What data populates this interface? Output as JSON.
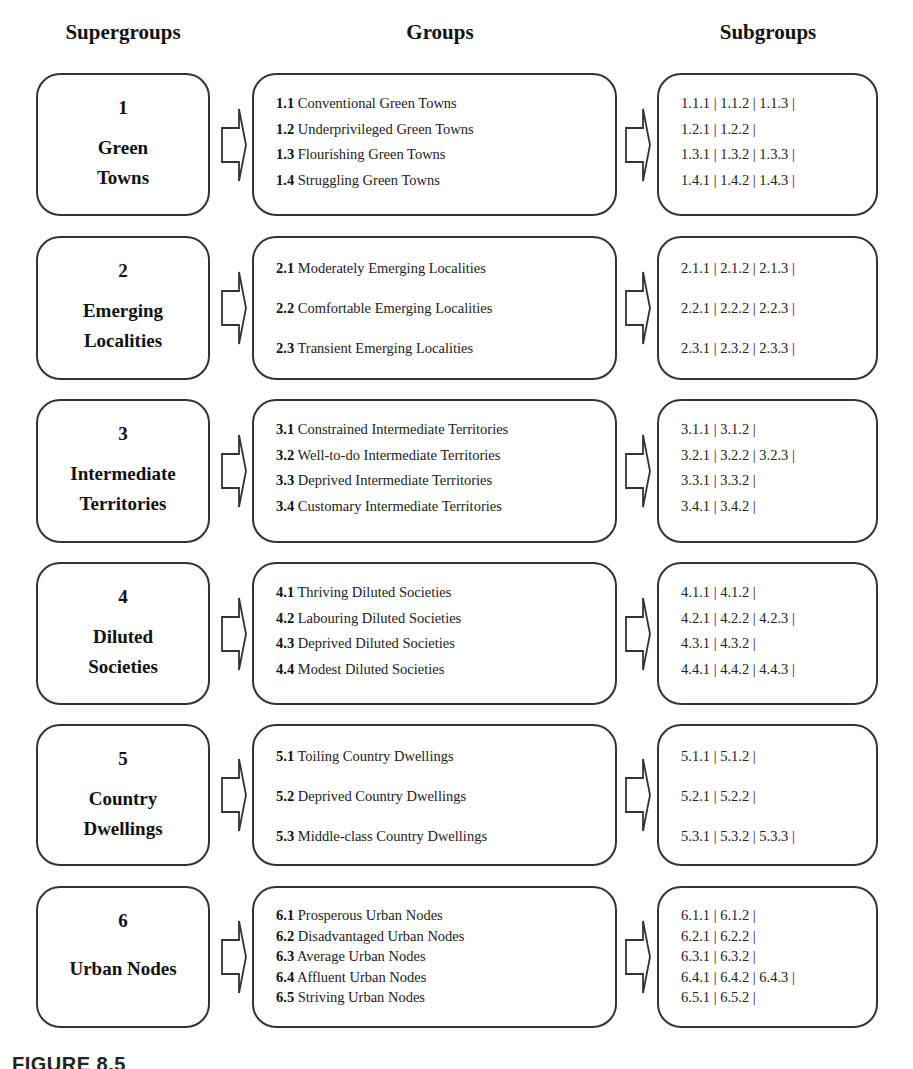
{
  "headers": {
    "supergroups": "Supergroups",
    "groups": "Groups",
    "subgroups": "Subgroups"
  },
  "rows": [
    {
      "number": "1",
      "name_lines": [
        "Green",
        "Towns"
      ],
      "groups": [
        {
          "code": "1.1",
          "name": "Conventional Green Towns"
        },
        {
          "code": "1.2",
          "name": "Underprivileged Green Towns"
        },
        {
          "code": "1.3",
          "name": "Flourishing Green Towns"
        },
        {
          "code": "1.4",
          "name": "Struggling Green Towns"
        }
      ],
      "subgroups": [
        "1.1.1 | 1.1.2 | 1.1.3 |",
        "1.2.1 | 1.2.2 |",
        "1.3.1 | 1.3.2 | 1.3.3 |",
        "1.4.1 | 1.4.2 | 1.4.3 |"
      ]
    },
    {
      "number": "2",
      "name_lines": [
        "Emerging",
        "Localities"
      ],
      "groups": [
        {
          "code": "2.1",
          "name": "Moderately Emerging Localities"
        },
        {
          "code": "2.2",
          "name": "Comfortable Emerging Localities"
        },
        {
          "code": "2.3",
          "name": "Transient Emerging Localities"
        }
      ],
      "subgroups": [
        "2.1.1 | 2.1.2 | 2.1.3 |",
        "2.2.1 | 2.2.2 | 2.2.3 |",
        "2.3.1 | 2.3.2 | 2.3.3 |"
      ]
    },
    {
      "number": "3",
      "name_lines": [
        "Intermediate",
        "Territories"
      ],
      "groups": [
        {
          "code": "3.1",
          "name": "Constrained Intermediate Territories"
        },
        {
          "code": "3.2",
          "name": "Well-to-do Intermediate Territories"
        },
        {
          "code": "3.3",
          "name": "Deprived Intermediate Territories"
        },
        {
          "code": "3.4",
          "name": "Customary Intermediate Territories"
        }
      ],
      "subgroups": [
        "3.1.1 | 3.1.2 |",
        "3.2.1 | 3.2.2 | 3.2.3 |",
        "3.3.1 | 3.3.2 |",
        "3.4.1 | 3.4.2 |"
      ]
    },
    {
      "number": "4",
      "name_lines": [
        "Diluted",
        "Societies"
      ],
      "groups": [
        {
          "code": "4.1",
          "name": "Thriving Diluted Societies"
        },
        {
          "code": "4.2",
          "name": "Labouring Diluted Societies"
        },
        {
          "code": "4.3",
          "name": "Deprived Diluted Societies"
        },
        {
          "code": "4.4",
          "name": "Modest Diluted Societies"
        }
      ],
      "subgroups": [
        "4.1.1 | 4.1.2 |",
        "4.2.1 | 4.2.2 | 4.2.3 |",
        "4.3.1 | 4.3.2 |",
        "4.4.1 | 4.4.2 | 4.4.3 |"
      ]
    },
    {
      "number": "5",
      "name_lines": [
        "Country",
        "Dwellings"
      ],
      "groups": [
        {
          "code": "5.1",
          "name": "Toiling Country Dwellings"
        },
        {
          "code": "5.2",
          "name": "Deprived Country Dwellings"
        },
        {
          "code": "5.3",
          "name": "Middle-class Country Dwellings"
        }
      ],
      "subgroups": [
        "5.1.1 | 5.1.2 |",
        "5.2.1 | 5.2.2 |",
        "5.3.1 | 5.3.2 | 5.3.3 |"
      ]
    },
    {
      "number": "6",
      "name_lines": [
        "Urban Nodes"
      ],
      "groups": [
        {
          "code": "6.1",
          "name": "Prosperous Urban Nodes"
        },
        {
          "code": "6.2",
          "name": "Disadvantaged Urban Nodes"
        },
        {
          "code": "6.3",
          "name": "Average Urban Nodes"
        },
        {
          "code": "6.4",
          "name": "Affluent Urban Nodes"
        },
        {
          "code": "6.5",
          "name": "Striving Urban Nodes"
        }
      ],
      "subgroups": [
        "6.1.1 | 6.1.2 |",
        "6.2.1 | 6.2.2 |",
        "6.3.1 | 6.3.2 |",
        "6.4.1 | 6.4.2 | 6.4.3 |",
        "6.5.1 | 6.5.2 |"
      ]
    }
  ],
  "caption": "FIGURE 8.5",
  "colors": {
    "border": "#333333",
    "text": "#1a1a1a",
    "background": "#ffffff"
  }
}
